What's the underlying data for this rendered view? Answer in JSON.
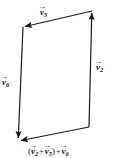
{
  "figure": {
    "type": "vector-addition-diagram",
    "width": 114,
    "height": 158,
    "background_color": "#ffffff",
    "stroke_color": "#1a1a1a",
    "stroke_width": 1.2
  },
  "labels": {
    "top_edge": {
      "name": "v5",
      "symbol": "v",
      "arrow_accent": "→",
      "subscript": "5",
      "text": "v⃗₅"
    },
    "right_edge": {
      "name": "v2",
      "symbol": "v",
      "arrow_accent": "→",
      "subscript": "2",
      "text": "v⃗₂"
    },
    "left_edge": {
      "name": "v6",
      "symbol": "v",
      "arrow_accent": "→",
      "subscript": "6",
      "text": "v⃗₆"
    },
    "resultant": {
      "name": "sum-expression",
      "open_paren": "(",
      "term1_symbol": "v",
      "term1_sub": "2",
      "plus1": "+",
      "term2_symbol": "v",
      "term2_sub": "5",
      "close_paren": ")",
      "plus2": "+",
      "term3_symbol": "v",
      "term3_sub": "6",
      "arrow_accent": "→",
      "text": "( v⃗₂ + v⃗₅ ) + v⃗₆"
    }
  },
  "vectors": [
    {
      "name": "v5",
      "from": [
        92,
        11
      ],
      "to": [
        23,
        27
      ],
      "direction": "left",
      "label_ref": "top_edge"
    },
    {
      "name": "v2",
      "from": [
        89,
        127
      ],
      "to": [
        92,
        11
      ],
      "direction": "up",
      "label_ref": "right_edge"
    },
    {
      "name": "v6",
      "from": [
        23,
        27
      ],
      "to": [
        18,
        140
      ],
      "direction": "down",
      "label_ref": "left_edge"
    },
    {
      "name": "resultant",
      "from": [
        89,
        127
      ],
      "to": [
        18,
        141
      ],
      "direction": "down-left",
      "label_ref": "resultant"
    }
  ]
}
